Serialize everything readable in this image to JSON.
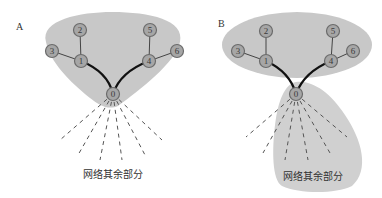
{
  "figure": {
    "panels": [
      {
        "label": "A",
        "nodes": [
          {
            "id": "0",
            "label": "0"
          },
          {
            "id": "1",
            "label": "1"
          },
          {
            "id": "2",
            "label": "2"
          },
          {
            "id": "3",
            "label": "3"
          },
          {
            "id": "4",
            "label": "4"
          },
          {
            "id": "5",
            "label": "5"
          },
          {
            "id": "6",
            "label": "6"
          }
        ],
        "edges": [
          [
            "1",
            "2"
          ],
          [
            "1",
            "3"
          ],
          [
            "4",
            "5"
          ],
          [
            "4",
            "6"
          ],
          [
            "0",
            "1"
          ],
          [
            "0",
            "4"
          ]
        ],
        "caption": "网络其余部分"
      },
      {
        "label": "B",
        "nodes": [
          {
            "id": "0",
            "label": "0"
          },
          {
            "id": "1",
            "label": "1"
          },
          {
            "id": "2",
            "label": "2"
          },
          {
            "id": "3",
            "label": "3"
          },
          {
            "id": "4",
            "label": "4"
          },
          {
            "id": "5",
            "label": "5"
          },
          {
            "id": "6",
            "label": "6"
          }
        ],
        "edges": [
          [
            "1",
            "2"
          ],
          [
            "1",
            "3"
          ],
          [
            "4",
            "5"
          ],
          [
            "4",
            "6"
          ],
          [
            "0",
            "1"
          ],
          [
            "0",
            "4"
          ]
        ],
        "caption": "网络其余部分"
      }
    ],
    "colors": {
      "region_fill": "#c8c8c8",
      "node_fill": "#a6a6a6",
      "edge": "#111111"
    }
  }
}
